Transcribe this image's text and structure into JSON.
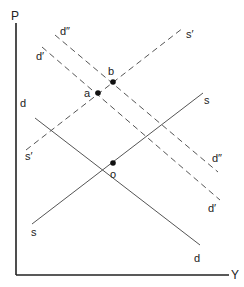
{
  "diagram": {
    "type": "supply-demand-shift",
    "colors": {
      "line": "#555555",
      "axis": "#222222",
      "point": "#111111",
      "background": "#ffffff"
    },
    "axes": {
      "y_label": "P",
      "x_label": "Y"
    },
    "curves": [
      {
        "id": "d",
        "style": "solid",
        "label_start": "d",
        "label_end": "d",
        "x1": 35,
        "y1": 118,
        "x2": 200,
        "y2": 245,
        "lx1": 20,
        "ly1": 107,
        "lx2": 194,
        "ly2": 262
      },
      {
        "id": "d1",
        "style": "dashed",
        "label_start": "d′",
        "label_end": "d′",
        "x1": 42,
        "y1": 47,
        "x2": 220,
        "y2": 200,
        "lx1": 36,
        "ly1": 60,
        "lx2": 208,
        "ly2": 212
      },
      {
        "id": "d2",
        "style": "dashed",
        "label_start": "d″",
        "label_end": "d″",
        "x1": 55,
        "y1": 35,
        "x2": 218,
        "y2": 172,
        "lx1": 60,
        "ly1": 35,
        "lx2": 212,
        "ly2": 162
      },
      {
        "id": "s",
        "style": "solid",
        "label_start": "s",
        "label_end": "s",
        "x1": 32,
        "y1": 224,
        "x2": 203,
        "y2": 93,
        "lx1": 31,
        "ly1": 236,
        "lx2": 204,
        "ly2": 104
      },
      {
        "id": "s1",
        "style": "dashed",
        "label_start": "s′",
        "label_end": "s′",
        "x1": 26,
        "y1": 150,
        "x2": 183,
        "y2": 28,
        "lx1": 25,
        "ly1": 160,
        "lx2": 186,
        "ly2": 38
      }
    ],
    "points": [
      {
        "id": "a",
        "label": "a",
        "x": 98,
        "y": 93,
        "lx": 84,
        "ly": 97
      },
      {
        "id": "b",
        "label": "b",
        "x": 113,
        "y": 82,
        "lx": 108,
        "ly": 75
      },
      {
        "id": "o",
        "label": "o",
        "x": 113,
        "y": 163,
        "lx": 110,
        "ly": 178
      }
    ]
  }
}
